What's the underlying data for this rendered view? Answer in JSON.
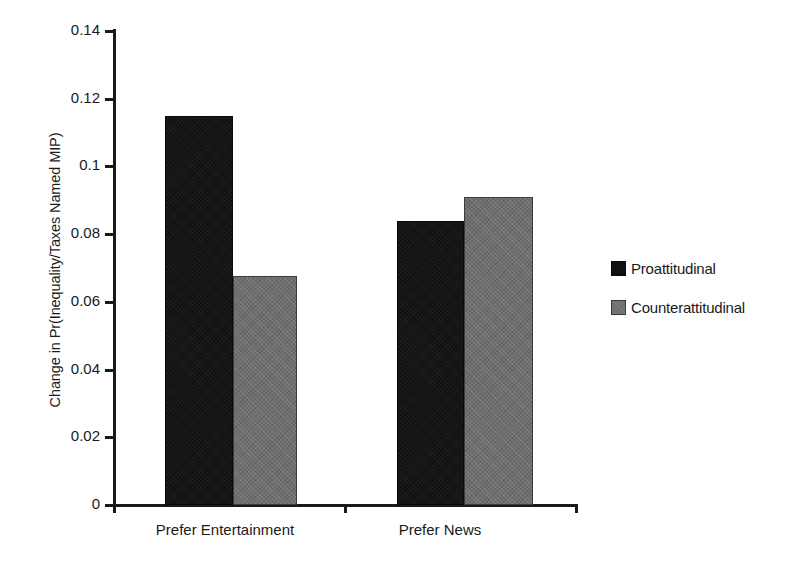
{
  "chart_data": {
    "type": "bar",
    "title": "",
    "subtitle": "",
    "xlabel": "",
    "ylabel": "Change in Pr(Inequality/Taxes Named MIP)",
    "categories": [
      "Prefer Entertainment",
      "Prefer News"
    ],
    "series": [
      {
        "name": "Proattitudinal",
        "color": "#111111",
        "values": [
          0.115,
          0.084
        ]
      },
      {
        "name": "Counterattitudinal",
        "color": "#6e6e6e",
        "values": [
          0.0675,
          0.091
        ]
      }
    ],
    "ylim": [
      0,
      0.14
    ],
    "ytick_values": [
      0,
      0.02,
      0.04,
      0.06,
      0.08,
      0.1,
      0.12,
      0.14
    ],
    "ytick_labels": [
      "0",
      "0.02",
      "0.04",
      "0.06",
      "0.08",
      "0.1",
      "0.12",
      "0.14"
    ],
    "grid": false,
    "legend_position": "right",
    "annotations": []
  },
  "legend": {
    "entries": [
      {
        "label": "Proattitudinal"
      },
      {
        "label": "Counterattitudinal"
      }
    ]
  }
}
